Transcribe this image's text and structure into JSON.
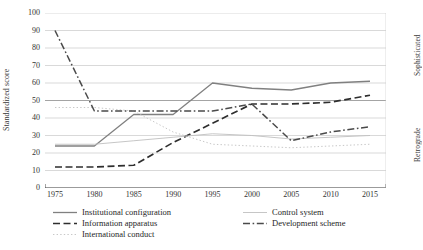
{
  "chart_data": {
    "type": "line",
    "title": "",
    "xlabel": "",
    "ylabel": "Standardized score",
    "xlim": [
      1975,
      2015
    ],
    "ylim": [
      0,
      100
    ],
    "grid": true,
    "legend_position": "bottom",
    "x": [
      1975,
      1980,
      1985,
      1990,
      1995,
      2000,
      2005,
      2010,
      2015
    ],
    "xticklabels": [
      "1975",
      "1980",
      "1985",
      "1990",
      "1995",
      "2000",
      "2005",
      "2010",
      "2015"
    ],
    "yticklabels": [
      "0",
      "10",
      "20",
      "30",
      "40",
      "50",
      "60",
      "70",
      "80",
      "90",
      "100"
    ],
    "yticks": [
      0,
      10,
      20,
      30,
      40,
      50,
      60,
      70,
      80,
      90,
      100
    ],
    "right_axis_labels": {
      "top": "Sophisticated",
      "bottom": "Retrograde"
    },
    "series": [
      {
        "name": "Institutional configuration",
        "style": "solid",
        "color": "#808080",
        "values": [
          24,
          24,
          42,
          42,
          60,
          57,
          56,
          60,
          61
        ]
      },
      {
        "name": "Information apparatus",
        "style": "dashed",
        "color": "#2e2e2e",
        "values": [
          12,
          12,
          13,
          26,
          37,
          48,
          48,
          49,
          53
        ]
      },
      {
        "name": "International conduct",
        "style": "dotted",
        "color": "#c8c8c8",
        "values": [
          46,
          46,
          44,
          32,
          25,
          24,
          23,
          24,
          25
        ]
      },
      {
        "name": "Control system",
        "style": "solid-light",
        "color": "#bfbfbf",
        "values": [
          25,
          25,
          27,
          29,
          31,
          30,
          28,
          29,
          30
        ]
      },
      {
        "name": "Development scheme",
        "style": "dashdot",
        "color": "#4a4a4a",
        "values": [
          90,
          44,
          44,
          44,
          44,
          48,
          27,
          32,
          35
        ]
      }
    ]
  },
  "legend": {
    "left_items": [
      {
        "label": "Institutional configuration",
        "style": "solid",
        "color": "#808080"
      },
      {
        "label": "Information apparatus",
        "style": "dashed",
        "color": "#2e2e2e"
      },
      {
        "label": "International conduct",
        "style": "dotted",
        "color": "#c8c8c8"
      }
    ],
    "right_items": [
      {
        "label": "Control system",
        "style": "solid-light",
        "color": "#bfbfbf"
      },
      {
        "label": "Development scheme",
        "style": "dashdot",
        "color": "#4a4a4a"
      }
    ]
  }
}
